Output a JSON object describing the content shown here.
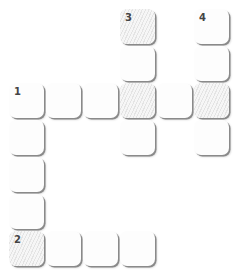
{
  "puzzle": {
    "type": "crossword",
    "cell_pitch": 37,
    "origin": {
      "x": 9,
      "y": 9
    },
    "cells": [
      {
        "row": 0,
        "col": 3,
        "number": "3",
        "letter": "",
        "hatched": true
      },
      {
        "row": 0,
        "col": 5,
        "number": "4",
        "letter": "",
        "hatched": false
      },
      {
        "row": 1,
        "col": 3,
        "number": "",
        "letter": "",
        "hatched": false
      },
      {
        "row": 1,
        "col": 5,
        "number": "",
        "letter": "",
        "hatched": false
      },
      {
        "row": 2,
        "col": 0,
        "number": "1",
        "letter": "",
        "hatched": false
      },
      {
        "row": 2,
        "col": 1,
        "number": "",
        "letter": "",
        "hatched": false
      },
      {
        "row": 2,
        "col": 2,
        "number": "",
        "letter": "",
        "hatched": false
      },
      {
        "row": 2,
        "col": 3,
        "number": "",
        "letter": "",
        "hatched": true
      },
      {
        "row": 2,
        "col": 4,
        "number": "",
        "letter": "",
        "hatched": false
      },
      {
        "row": 2,
        "col": 5,
        "number": "",
        "letter": "",
        "hatched": true
      },
      {
        "row": 3,
        "col": 0,
        "number": "",
        "letter": "",
        "hatched": false
      },
      {
        "row": 3,
        "col": 3,
        "number": "",
        "letter": "",
        "hatched": false
      },
      {
        "row": 3,
        "col": 5,
        "number": "",
        "letter": "",
        "hatched": false
      },
      {
        "row": 4,
        "col": 0,
        "number": "",
        "letter": "",
        "hatched": false
      },
      {
        "row": 5,
        "col": 0,
        "number": "",
        "letter": "",
        "hatched": false
      },
      {
        "row": 6,
        "col": 0,
        "number": "2",
        "letter": "",
        "hatched": true
      },
      {
        "row": 6,
        "col": 1,
        "number": "",
        "letter": "",
        "hatched": false
      },
      {
        "row": 6,
        "col": 2,
        "number": "",
        "letter": "",
        "hatched": false
      },
      {
        "row": 6,
        "col": 3,
        "number": "",
        "letter": "",
        "hatched": false
      }
    ]
  }
}
